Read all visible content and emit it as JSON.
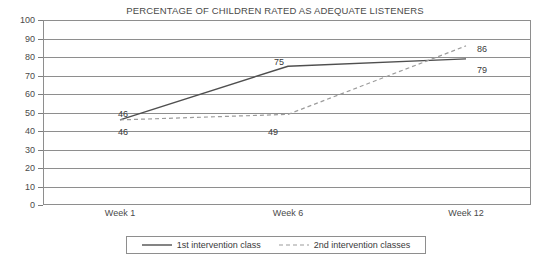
{
  "chart_data": {
    "type": "line",
    "title": "PERCENTAGE OF CHILDREN RATED AS ADEQUATE LISTENERS",
    "xlabel": "",
    "ylabel": "",
    "categories": [
      "Week 1",
      "Week 6",
      "Week 12"
    ],
    "ylim": [
      0,
      100
    ],
    "yticks": [
      0,
      10,
      20,
      30,
      40,
      50,
      60,
      70,
      80,
      90,
      100
    ],
    "grid": true,
    "legend_position": "bottom",
    "series": [
      {
        "name": "1st intervention class",
        "style": "solid",
        "color": "#4f4f4f",
        "values": [
          46,
          75,
          79
        ],
        "labels": [
          "46",
          "75",
          "79"
        ]
      },
      {
        "name": "2nd intervention classes",
        "style": "dashed",
        "color": "#9c9c9c",
        "values": [
          46,
          49,
          86
        ],
        "labels": [
          "46",
          "49",
          "86"
        ]
      }
    ]
  },
  "axis": {
    "y_tick_labels": [
      "100",
      "90",
      "80",
      "70",
      "60",
      "50",
      "40",
      "30",
      "20",
      "10",
      "0"
    ],
    "x_tick_labels": [
      "Week 1",
      "Week 6",
      "Week 12"
    ]
  },
  "data_labels": [
    {
      "text": "46",
      "x": 118,
      "y": 110
    },
    {
      "text": "46",
      "x": 118,
      "y": 128
    },
    {
      "text": "75",
      "x": 274,
      "y": 58
    },
    {
      "text": "49",
      "x": 268,
      "y": 128
    },
    {
      "text": "86",
      "x": 477,
      "y": 45
    },
    {
      "text": "79",
      "x": 477,
      "y": 66
    }
  ],
  "legend": {
    "entries": [
      {
        "label": "1st intervention class",
        "style": "solid",
        "color": "#4f4f4f"
      },
      {
        "label": "2nd intervention classes",
        "style": "dashed",
        "color": "#9c9c9c"
      }
    ]
  },
  "colors": {
    "series_1": "#4f4f4f",
    "series_2": "#9c9c9c",
    "grid": "#8e8e8e",
    "frame": "#8e8e8e",
    "text": "#3a3a3a"
  }
}
